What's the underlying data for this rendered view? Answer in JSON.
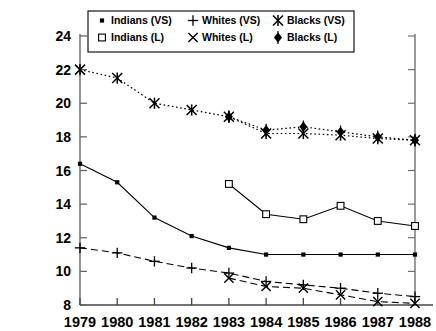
{
  "chart_data": {
    "type": "line",
    "title": "",
    "subtitle": "",
    "xlabel": "",
    "ylabel": "",
    "x": [
      1979,
      1980,
      1981,
      1982,
      1983,
      1984,
      1985,
      1986,
      1987,
      1988
    ],
    "categories": [
      "1979",
      "1980",
      "1981",
      "1982",
      "1983",
      "1984",
      "1985",
      "1986",
      "1987",
      "1988"
    ],
    "xlim": [
      1979,
      1988
    ],
    "ylim": [
      8,
      24
    ],
    "yticks": [
      8,
      10,
      12,
      14,
      16,
      18,
      20,
      22,
      24
    ],
    "ytick_labels": [
      "8",
      "10",
      "12",
      "14",
      "16",
      "18",
      "20",
      "22",
      "24"
    ],
    "grid": false,
    "legend_position": "top-center",
    "series": [
      {
        "name": "Indians (VS)",
        "marker": "filled-square-small",
        "line_style": "solid",
        "values": [
          16.4,
          15.3,
          13.2,
          12.1,
          11.4,
          11.0,
          11.0,
          11.0,
          11.0,
          11.0
        ]
      },
      {
        "name": "Whites (VS)",
        "marker": "plus",
        "line_style": "dashed",
        "values": [
          11.4,
          11.1,
          10.6,
          10.2,
          9.9,
          9.4,
          9.2,
          9.0,
          8.7,
          8.5
        ]
      },
      {
        "name": "Blacks (VS)",
        "marker": "asterisk",
        "line_style": "dotted",
        "values": [
          22.0,
          21.5,
          20.0,
          19.6,
          19.2,
          18.2,
          18.2,
          18.1,
          17.9,
          17.8
        ]
      },
      {
        "name": "Indians (L)",
        "marker": "open-square",
        "line_style": "solid",
        "values": [
          null,
          null,
          null,
          null,
          15.2,
          13.4,
          13.1,
          13.9,
          13.0,
          12.7
        ]
      },
      {
        "name": "Whites (L)",
        "marker": "x-cross",
        "line_style": "dashed",
        "values": [
          null,
          null,
          null,
          null,
          9.6,
          9.1,
          9.0,
          8.6,
          8.2,
          8.1
        ]
      },
      {
        "name": "Blacks (L)",
        "marker": "filled-diamond",
        "line_style": "dotted",
        "values": [
          null,
          null,
          null,
          null,
          19.2,
          18.4,
          18.6,
          18.3,
          18.0,
          17.8
        ]
      }
    ]
  },
  "legend": {
    "entries": [
      {
        "label": "Indians (VS)",
        "marker": "filled-square-small"
      },
      {
        "label": "Whites (VS)",
        "marker": "plus"
      },
      {
        "label": "Blacks (VS)",
        "marker": "asterisk"
      },
      {
        "label": "Indians (L)",
        "marker": "open-square"
      },
      {
        "label": "Whites (L)",
        "marker": "x-cross"
      },
      {
        "label": "Blacks (L)",
        "marker": "filled-diamond"
      }
    ]
  },
  "axes": {
    "y_tick_labels": [
      "24",
      "22",
      "20",
      "18",
      "16",
      "14",
      "12",
      "10",
      "8"
    ],
    "x_tick_labels": [
      "1979",
      "1980",
      "1981",
      "1982",
      "1983",
      "1984",
      "1985",
      "1986",
      "1987",
      "1988"
    ]
  },
  "colors": {
    "ink": "#000000",
    "axis": "#555555",
    "background": "#ffffff"
  }
}
